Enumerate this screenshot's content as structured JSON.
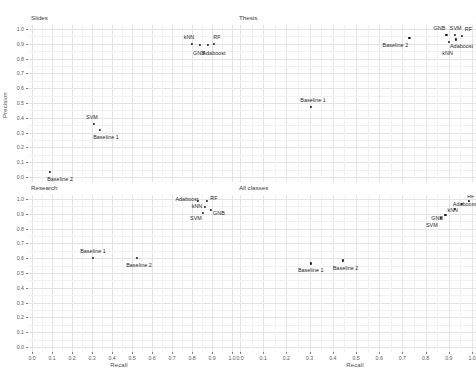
{
  "chart_data": {
    "type": "scatter",
    "title": "",
    "xlabel": "Recall",
    "ylabel": "Precision",
    "xlim": [
      0.0,
      1.0
    ],
    "ylim": [
      0.0,
      1.0
    ],
    "xticks": [
      "0.0",
      "0.1",
      "0.2",
      "0.3",
      "0.4",
      "0.5",
      "0.6",
      "0.7",
      "0.8",
      "0.9",
      "1.0"
    ],
    "yticks": [
      "0.0",
      "0.1",
      "0.2",
      "0.3",
      "0.4",
      "0.5",
      "0.6",
      "0.7",
      "0.8",
      "0.9",
      "1.0"
    ],
    "grid": true,
    "legend": "none",
    "facet_layout": "2x2",
    "point_color": "#1a1a1a",
    "grid_color": "#ebebeb",
    "panels": [
      {
        "name": "Slides",
        "points": [
          {
            "label": "kNN",
            "x": 0.8,
            "y": 0.9,
            "label_dx": -0.015,
            "label_dy": 0.045
          },
          {
            "label": "GNB",
            "x": 0.84,
            "y": 0.89,
            "label_dx": -0.005,
            "label_dy": -0.05
          },
          {
            "label": "Adaboost",
            "x": 0.88,
            "y": 0.89,
            "label_dx": 0.03,
            "label_dy": -0.05
          },
          {
            "label": "RF",
            "x": 0.91,
            "y": 0.9,
            "label_dx": 0.015,
            "label_dy": 0.045
          },
          {
            "label": "SVM",
            "x": 0.31,
            "y": 0.36,
            "label_dx": -0.01,
            "label_dy": 0.048
          },
          {
            "label": "Baseline 1",
            "x": 0.34,
            "y": 0.32,
            "label_dx": 0.03,
            "label_dy": -0.05
          },
          {
            "label": "Baseline 2",
            "x": 0.09,
            "y": 0.035,
            "label_dx": 0.05,
            "label_dy": -0.048
          }
        ]
      },
      {
        "name": "Thesis",
        "points": [
          {
            "label": "Baseline 2",
            "x": 0.73,
            "y": 0.94,
            "label_dx": -0.06,
            "label_dy": -0.045
          },
          {
            "label": "GNB",
            "x": 0.89,
            "y": 0.96,
            "label_dx": -0.03,
            "label_dy": 0.045
          },
          {
            "label": "SVM",
            "x": 0.925,
            "y": 0.96,
            "label_dx": 0.005,
            "label_dy": 0.047
          },
          {
            "label": "RF",
            "x": 0.955,
            "y": 0.955,
            "label_dx": 0.03,
            "label_dy": 0.045
          },
          {
            "label": "Adaboost",
            "x": 0.93,
            "y": 0.93,
            "label_dx": 0.025,
            "label_dy": -0.042
          },
          {
            "label": "kNN",
            "x": 0.9,
            "y": 0.915,
            "label_dx": -0.005,
            "label_dy": -0.075
          },
          {
            "label": "Baseline 1",
            "x": 0.305,
            "y": 0.475,
            "label_dx": 0.01,
            "label_dy": 0.047
          }
        ]
      },
      {
        "name": "Research",
        "points": [
          {
            "label": "Adaboost",
            "x": 0.83,
            "y": 0.985,
            "label_dx": -0.055,
            "label_dy": 0.018
          },
          {
            "label": "RF",
            "x": 0.875,
            "y": 0.985,
            "label_dx": 0.035,
            "label_dy": 0.022
          },
          {
            "label": "kNN",
            "x": 0.865,
            "y": 0.945,
            "label_dx": -0.04,
            "label_dy": 0.005
          },
          {
            "label": "GNB",
            "x": 0.895,
            "y": 0.925,
            "label_dx": 0.04,
            "label_dy": -0.02
          },
          {
            "label": "SVM",
            "x": 0.855,
            "y": 0.905,
            "label_dx": -0.035,
            "label_dy": -0.03
          },
          {
            "label": "Baseline 1",
            "x": 0.305,
            "y": 0.6,
            "label_dx": 0.0,
            "label_dy": 0.048
          },
          {
            "label": "Baseline 2",
            "x": 0.525,
            "y": 0.6,
            "label_dx": 0.01,
            "label_dy": -0.048
          }
        ]
      },
      {
        "name": "All classes",
        "points": [
          {
            "label": "RF",
            "x": 0.985,
            "y": 0.985,
            "label_dx": 0.01,
            "label_dy": 0.035
          },
          {
            "label": "Adaboost",
            "x": 0.955,
            "y": 0.965,
            "label_dx": 0.012,
            "label_dy": 0.0
          },
          {
            "label": "kNN",
            "x": 0.925,
            "y": 0.935,
            "label_dx": -0.008,
            "label_dy": -0.012
          },
          {
            "label": "GNB",
            "x": 0.885,
            "y": 0.895,
            "label_dx": -0.035,
            "label_dy": -0.022
          },
          {
            "label": "SVM",
            "x": 0.865,
            "y": 0.875,
            "label_dx": -0.038,
            "label_dy": -0.048
          },
          {
            "label": "Baseline 1",
            "x": 0.305,
            "y": 0.565,
            "label_dx": 0.0,
            "label_dy": -0.048
          },
          {
            "label": "Baseline 2",
            "x": 0.445,
            "y": 0.585,
            "label_dx": 0.01,
            "label_dy": -0.048
          }
        ]
      }
    ]
  }
}
